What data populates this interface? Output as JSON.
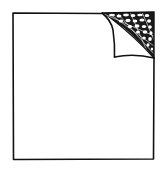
{
  "illustration": {
    "subject": "blank sheet of paper with curled top-right corner",
    "label": "Page curl illustration",
    "colors": {
      "background": "#ffffff",
      "paper": "#ffffff",
      "ink": "#111111",
      "shadow": "#1a1a1a"
    }
  },
  "icons": [
    {
      "name": "page-curl-icon"
    }
  ]
}
